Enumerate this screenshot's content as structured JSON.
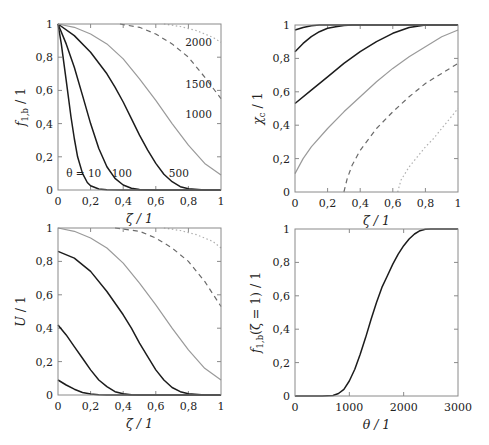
{
  "chart_data": [
    {
      "id": "tl",
      "type": "line",
      "title": "",
      "xlabel": "ζ / 1",
      "ylabel": "f1,b / 1",
      "ylabel_main": "f",
      "ylabel_sub": "1,b",
      "ylabel_rest": " / 1",
      "xlim": [
        0,
        1
      ],
      "ylim": [
        0,
        1
      ],
      "xticks": [
        "0",
        "0,2",
        "0,4",
        "0,6",
        "0,8",
        "1"
      ],
      "yticks": [
        "0",
        "0,2",
        "0,4",
        "0,6",
        "0,8",
        "1"
      ],
      "grid": false,
      "box": {
        "x0": 58,
        "y0": 24,
        "x1": 221,
        "y1": 190
      },
      "annotations": [
        {
          "text": "θ = 10",
          "x": 0.05,
          "y": 0.1
        },
        {
          "text": "100",
          "x": 0.33,
          "y": 0.1
        },
        {
          "text": "500",
          "x": 0.68,
          "y": 0.1
        },
        {
          "text": "1000",
          "x": 0.78,
          "y": 0.46
        },
        {
          "text": "1500",
          "x": 0.78,
          "y": 0.64
        },
        {
          "text": "2000",
          "x": 0.78,
          "y": 0.89
        }
      ],
      "series": [
        {
          "name": "θ = 10",
          "style": "solid-dark",
          "x": [
            0,
            0.02,
            0.05,
            0.08,
            0.1,
            0.12,
            0.15,
            0.18,
            0.2,
            0.25,
            0.3,
            0.4,
            0.5,
            1
          ],
          "y": [
            1,
            0.88,
            0.66,
            0.44,
            0.31,
            0.2,
            0.1,
            0.045,
            0.025,
            0.006,
            0.001,
            0,
            0,
            0
          ]
        },
        {
          "name": "θ = 100",
          "style": "solid-dark",
          "x": [
            0,
            0.05,
            0.1,
            0.15,
            0.2,
            0.25,
            0.3,
            0.35,
            0.4,
            0.45,
            0.5,
            0.6,
            1
          ],
          "y": [
            1,
            0.88,
            0.74,
            0.57,
            0.4,
            0.25,
            0.14,
            0.07,
            0.03,
            0.01,
            0.003,
            0,
            0
          ]
        },
        {
          "name": "θ = 500",
          "style": "solid-dark",
          "x": [
            0,
            0.1,
            0.2,
            0.3,
            0.35,
            0.4,
            0.45,
            0.5,
            0.55,
            0.6,
            0.65,
            0.7,
            0.75,
            0.8,
            0.9,
            1
          ],
          "y": [
            1,
            0.93,
            0.83,
            0.7,
            0.62,
            0.53,
            0.43,
            0.33,
            0.24,
            0.16,
            0.095,
            0.05,
            0.02,
            0.007,
            0,
            0
          ]
        },
        {
          "name": "θ = 1000",
          "style": "solid-light",
          "x": [
            0,
            0.1,
            0.2,
            0.3,
            0.4,
            0.5,
            0.6,
            0.7,
            0.8,
            0.9,
            1
          ],
          "y": [
            1,
            0.98,
            0.94,
            0.88,
            0.79,
            0.67,
            0.54,
            0.4,
            0.27,
            0.16,
            0.09
          ]
        },
        {
          "name": "θ = 1500",
          "style": "dashed",
          "x": [
            0.38,
            0.5,
            0.6,
            0.7,
            0.8,
            0.9,
            1
          ],
          "y": [
            1,
            0.98,
            0.94,
            0.88,
            0.8,
            0.68,
            0.55
          ]
        },
        {
          "name": "θ = 2000",
          "style": "dotted",
          "x": [
            0.65,
            0.75,
            0.85,
            0.95,
            1
          ],
          "y": [
            1,
            0.985,
            0.96,
            0.92,
            0.89
          ]
        }
      ]
    },
    {
      "id": "tr",
      "type": "line",
      "title": "",
      "xlabel": "ζ / 1",
      "ylabel": "χc / 1",
      "ylabel_main": "χ",
      "ylabel_sub": "c",
      "ylabel_rest": " / 1",
      "xlim": [
        0,
        1
      ],
      "ylim": [
        0,
        1
      ],
      "xticks": [
        "0",
        "0,2",
        "0,4",
        "0,6",
        "0,8",
        "1"
      ],
      "yticks": [
        "0",
        "0,2",
        "0,4",
        "0,6",
        "0,8",
        "1"
      ],
      "grid": false,
      "box": {
        "x0": 295,
        "y0": 25,
        "x1": 458,
        "y1": 192
      },
      "annotations": [],
      "series": [
        {
          "name": "θ = 10",
          "style": "solid-dark",
          "x": [
            0,
            0.05,
            0.1,
            0.15,
            0.2,
            1
          ],
          "y": [
            0.97,
            0.985,
            0.995,
            1,
            1,
            1
          ]
        },
        {
          "name": "θ = 100",
          "style": "solid-dark",
          "x": [
            0,
            0.05,
            0.1,
            0.15,
            0.2,
            0.25,
            0.3,
            0.35,
            0.4,
            1
          ],
          "y": [
            0.84,
            0.89,
            0.93,
            0.96,
            0.98,
            0.99,
            0.997,
            1,
            1,
            1
          ]
        },
        {
          "name": "θ = 500",
          "style": "solid-dark",
          "x": [
            0,
            0.1,
            0.2,
            0.3,
            0.4,
            0.5,
            0.6,
            0.7,
            0.8,
            1
          ],
          "y": [
            0.53,
            0.61,
            0.69,
            0.77,
            0.84,
            0.9,
            0.95,
            0.985,
            1,
            1
          ]
        },
        {
          "name": "θ = 1000",
          "style": "solid-light",
          "x": [
            0,
            0.05,
            0.1,
            0.2,
            0.3,
            0.4,
            0.5,
            0.6,
            0.7,
            0.8,
            0.9,
            1
          ],
          "y": [
            0.11,
            0.2,
            0.27,
            0.38,
            0.48,
            0.57,
            0.66,
            0.74,
            0.81,
            0.87,
            0.93,
            0.97
          ]
        },
        {
          "name": "θ = 1500",
          "style": "dashed",
          "x": [
            0.3,
            0.32,
            0.35,
            0.4,
            0.5,
            0.6,
            0.7,
            0.8,
            0.9,
            1
          ],
          "y": [
            0,
            0.08,
            0.16,
            0.25,
            0.38,
            0.48,
            0.57,
            0.65,
            0.71,
            0.77
          ]
        },
        {
          "name": "θ = 2000",
          "style": "dotted",
          "x": [
            0.63,
            0.65,
            0.7,
            0.75,
            0.8,
            0.85,
            0.9,
            0.95,
            1
          ],
          "y": [
            0,
            0.07,
            0.15,
            0.21,
            0.27,
            0.32,
            0.38,
            0.44,
            0.5
          ]
        }
      ]
    },
    {
      "id": "bl",
      "type": "line",
      "title": "",
      "xlabel": "ζ / 1",
      "ylabel": "U / 1",
      "ylabel_main": "U",
      "ylabel_sub": "",
      "ylabel_rest": " / 1",
      "xlim": [
        0,
        1
      ],
      "ylim": [
        0,
        1
      ],
      "xticks": [
        "0",
        "0,2",
        "0,4",
        "0,6",
        "0,8",
        "1"
      ],
      "yticks": [
        "0",
        "0,2",
        "0,4",
        "0,6",
        "0,8",
        "1"
      ],
      "grid": false,
      "box": {
        "x0": 58,
        "y0": 228,
        "x1": 221,
        "y1": 395
      },
      "annotations": [],
      "series": [
        {
          "name": "θ = 10",
          "style": "solid-dark",
          "x": [
            0,
            0.05,
            0.1,
            0.15,
            0.2,
            0.25,
            0.3,
            1
          ],
          "y": [
            0.09,
            0.06,
            0.035,
            0.015,
            0.006,
            0.002,
            0,
            0
          ]
        },
        {
          "name": "θ = 100",
          "style": "solid-dark",
          "x": [
            0,
            0.05,
            0.1,
            0.15,
            0.2,
            0.25,
            0.3,
            0.35,
            0.4,
            0.45,
            0.5,
            1
          ],
          "y": [
            0.42,
            0.36,
            0.29,
            0.22,
            0.15,
            0.09,
            0.05,
            0.02,
            0.007,
            0.002,
            0,
            0
          ]
        },
        {
          "name": "θ = 500",
          "style": "solid-dark",
          "x": [
            0,
            0.1,
            0.2,
            0.3,
            0.4,
            0.45,
            0.5,
            0.55,
            0.6,
            0.65,
            0.7,
            0.75,
            0.8,
            0.9,
            1
          ],
          "y": [
            0.86,
            0.82,
            0.74,
            0.62,
            0.48,
            0.4,
            0.31,
            0.23,
            0.15,
            0.09,
            0.045,
            0.02,
            0.007,
            0,
            0
          ]
        },
        {
          "name": "θ = 1000",
          "style": "solid-light",
          "x": [
            0,
            0.1,
            0.2,
            0.3,
            0.4,
            0.5,
            0.6,
            0.7,
            0.8,
            0.9,
            1
          ],
          "y": [
            1,
            0.98,
            0.94,
            0.88,
            0.79,
            0.67,
            0.54,
            0.4,
            0.27,
            0.16,
            0.09
          ]
        },
        {
          "name": "θ = 1500",
          "style": "dashed",
          "x": [
            0.35,
            0.5,
            0.6,
            0.7,
            0.8,
            0.9,
            1
          ],
          "y": [
            1,
            0.98,
            0.94,
            0.88,
            0.8,
            0.68,
            0.53
          ]
        },
        {
          "name": "θ = 2000",
          "style": "dotted",
          "x": [
            0.65,
            0.75,
            0.85,
            0.95,
            1
          ],
          "y": [
            1,
            0.985,
            0.96,
            0.92,
            0.88
          ]
        }
      ]
    },
    {
      "id": "br",
      "type": "line",
      "title": "",
      "xlabel": "θ / 1",
      "ylabel": "f1,b(ζ = 1) / 1",
      "ylabel_main": "f",
      "ylabel_sub": "1,b",
      "ylabel_rest": "(ζ = 1) / 1",
      "xlim": [
        0,
        3000
      ],
      "ylim": [
        0,
        1
      ],
      "xticks": [
        "0",
        "1000",
        "2000",
        "3000"
      ],
      "yticks": [
        "0",
        "0,2",
        "0,4",
        "0,6",
        "0,8",
        "1"
      ],
      "grid": false,
      "box": {
        "x0": 295,
        "y0": 229,
        "x1": 458,
        "y1": 396
      },
      "annotations": [],
      "series": [
        {
          "name": "f1,b(ζ=1)",
          "style": "solid-dark",
          "x": [
            0,
            500,
            700,
            800,
            900,
            1000,
            1100,
            1200,
            1300,
            1400,
            1500,
            1600,
            1700,
            1800,
            1900,
            2000,
            2100,
            2200,
            2300,
            2400,
            2500,
            3000
          ],
          "y": [
            0,
            0,
            0.003,
            0.015,
            0.04,
            0.09,
            0.16,
            0.25,
            0.35,
            0.46,
            0.56,
            0.65,
            0.72,
            0.79,
            0.85,
            0.9,
            0.94,
            0.97,
            0.99,
            0.998,
            1,
            1
          ]
        }
      ]
    }
  ],
  "header_fragment": "",
  "colors": {
    "dark": "#1c1c1c",
    "light": "#9a9a9a",
    "frame": "#8a8a8a"
  }
}
